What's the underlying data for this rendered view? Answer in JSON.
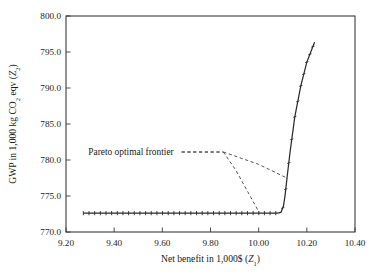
{
  "chart_data": {
    "type": "line",
    "title": "",
    "xlabel": "Net benefit in 1,000$ (Z₁)",
    "xlabel_main": "Net benefit in 1,000$ (",
    "xlabel_var": "Z",
    "xlabel_sub": "1",
    "xlabel_tail": ")",
    "ylabel": "GWP in 1,000 kg CO₂ eqv (Z₂)",
    "ylabel_main": "GWP in 1,000 kg CO",
    "ylabel_sub1": "2",
    "ylabel_mid": " eqv (",
    "ylabel_var": "Z",
    "ylabel_sub2": "2",
    "ylabel_tail": ")",
    "xlim": [
      9.2,
      10.4
    ],
    "ylim": [
      770.0,
      800.0
    ],
    "xticks": [
      9.2,
      9.4,
      9.6,
      9.8,
      10.0,
      10.2,
      10.4
    ],
    "xticklabels": [
      "9.20",
      "9.40",
      "9.60",
      "9.80",
      "10.00",
      "10.20",
      "10.40"
    ],
    "yticks": [
      770.0,
      775.0,
      780.0,
      785.0,
      790.0,
      795.0,
      800.0
    ],
    "yticklabels": [
      "770.0",
      "775.0",
      "780.0",
      "785.0",
      "790.0",
      "795.0",
      "800.0"
    ],
    "grid": false,
    "legend": null,
    "annotations": [
      {
        "text": "Pareto optimal frontier",
        "x": 9.47,
        "y": 781.2,
        "leader_from": [
          9.68,
          781.1
        ],
        "leader_to": [
          9.85,
          781.1
        ]
      }
    ],
    "series": [
      {
        "name": "pareto-frontier-solid",
        "style": "solid",
        "markers": "tick",
        "points": [
          [
            9.272,
            772.62
          ],
          [
            9.4,
            772.62
          ],
          [
            9.5,
            772.62
          ],
          [
            9.6,
            772.62
          ],
          [
            9.7,
            772.62
          ],
          [
            9.8,
            772.62
          ],
          [
            9.9,
            772.62
          ],
          [
            10.0,
            772.62
          ],
          [
            10.05,
            772.62
          ],
          [
            10.08,
            772.63
          ],
          [
            10.093,
            772.75
          ],
          [
            10.103,
            773.6
          ],
          [
            10.11,
            775.2
          ],
          [
            10.118,
            777.6
          ],
          [
            10.13,
            781.0
          ],
          [
            10.15,
            786.0
          ],
          [
            10.175,
            790.3
          ],
          [
            10.2,
            793.6
          ],
          [
            10.232,
            796.35
          ]
        ]
      },
      {
        "name": "frontier-plateau-dashed",
        "style": "dashed",
        "points": [
          [
            9.68,
            781.12
          ],
          [
            9.853,
            781.12
          ]
        ]
      },
      {
        "name": "frontier-branch-shallow-dashed",
        "style": "dashed",
        "points": [
          [
            9.853,
            781.12
          ],
          [
            10.0,
            779.4
          ],
          [
            10.122,
            777.42
          ]
        ]
      },
      {
        "name": "frontier-branch-steep-dashed",
        "style": "dashed",
        "points": [
          [
            9.853,
            781.12
          ],
          [
            9.905,
            778.6
          ],
          [
            10.003,
            772.66
          ]
        ]
      }
    ]
  },
  "figure": {
    "background_color": "#ffffff",
    "axis_color": "#3b3b3b",
    "solid_curve_color": "#2b2b2b",
    "dashed_curve_color": "#4a4a4a"
  }
}
